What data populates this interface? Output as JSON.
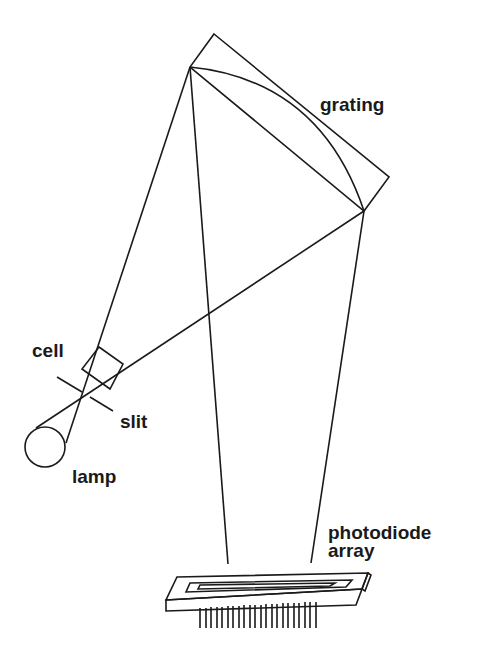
{
  "diagram": {
    "labels": {
      "grating": "grating",
      "cell": "cell",
      "slit": "slit",
      "lamp": "lamp",
      "detector_line1": "photodiode",
      "detector_line2": "array"
    },
    "colors": {
      "ink": "#1a1a1a",
      "background": "#ffffff"
    }
  }
}
